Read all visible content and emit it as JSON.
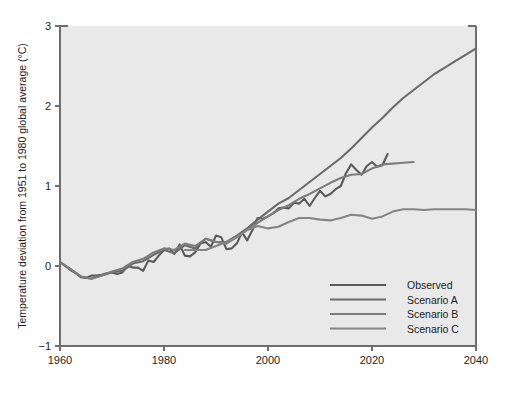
{
  "chart_data": {
    "type": "line",
    "title": "",
    "xlabel": "",
    "ylabel": "Temperature deviation from 1951 to 1980 global average (°C)",
    "xlim": [
      1960,
      2040
    ],
    "ylim": [
      -1,
      3
    ],
    "xticks": [
      1960,
      1980,
      2000,
      2020,
      2040
    ],
    "yticks": [
      -1,
      0,
      1,
      2,
      3
    ],
    "xtick_labels": [
      "1960",
      "1980",
      "2000",
      "2020",
      "2040"
    ],
    "ytick_labels": [
      "−1",
      "0",
      "1",
      "2",
      "3"
    ],
    "grid": false,
    "legend_position": "lower-right",
    "plot_background": "#e9e9e9",
    "series": [
      {
        "name": "Observed",
        "color": "#5a5a5a",
        "x": [
          1960,
          1961,
          1962,
          1963,
          1964,
          1965,
          1966,
          1967,
          1968,
          1969,
          1970,
          1971,
          1972,
          1973,
          1974,
          1975,
          1976,
          1977,
          1978,
          1979,
          1980,
          1981,
          1982,
          1983,
          1984,
          1985,
          1986,
          1987,
          1988,
          1989,
          1990,
          1991,
          1992,
          1993,
          1994,
          1995,
          1996,
          1997,
          1998,
          1999,
          2000,
          2001,
          2002,
          2003,
          2004,
          2005,
          2006,
          2007,
          2008,
          2009,
          2010,
          2011,
          2012,
          2013,
          2014,
          2015,
          2016,
          2017,
          2018,
          2019,
          2020,
          2021,
          2022,
          2023
        ],
        "y": [
          0.05,
          0.0,
          -0.05,
          -0.09,
          -0.14,
          -0.15,
          -0.12,
          -0.12,
          -0.11,
          -0.09,
          -0.08,
          -0.1,
          -0.08,
          0.0,
          -0.02,
          -0.02,
          -0.06,
          0.07,
          0.05,
          0.13,
          0.2,
          0.22,
          0.15,
          0.27,
          0.13,
          0.12,
          0.17,
          0.28,
          0.3,
          0.24,
          0.38,
          0.36,
          0.21,
          0.22,
          0.28,
          0.42,
          0.32,
          0.45,
          0.6,
          0.59,
          0.62,
          0.66,
          0.72,
          0.73,
          0.72,
          0.79,
          0.78,
          0.84,
          0.75,
          0.85,
          0.94,
          0.87,
          0.9,
          0.96,
          1.0,
          1.16,
          1.27,
          1.2,
          1.14,
          1.25,
          1.3,
          1.24,
          1.26,
          1.4
        ],
        "end_value": 1.4,
        "end_year": 2023
      },
      {
        "name": "Scenario A",
        "color": "#6b6b6b",
        "x": [
          1960,
          1962,
          1964,
          1966,
          1968,
          1970,
          1972,
          1974,
          1976,
          1978,
          1980,
          1982,
          1984,
          1986,
          1988,
          1990,
          1992,
          1994,
          1996,
          1998,
          2000,
          2002,
          2004,
          2006,
          2008,
          2010,
          2012,
          2014,
          2016,
          2018,
          2020,
          2022,
          2024,
          2026,
          2028,
          2030,
          2032,
          2034,
          2036,
          2038,
          2040
        ],
        "y": [
          0.05,
          -0.04,
          -0.13,
          -0.16,
          -0.12,
          -0.08,
          -0.06,
          0.03,
          0.06,
          0.14,
          0.2,
          0.16,
          0.26,
          0.22,
          0.34,
          0.3,
          0.3,
          0.38,
          0.47,
          0.58,
          0.68,
          0.78,
          0.85,
          0.95,
          1.05,
          1.15,
          1.25,
          1.35,
          1.47,
          1.6,
          1.73,
          1.85,
          1.98,
          2.1,
          2.2,
          2.3,
          2.4,
          2.48,
          2.56,
          2.64,
          2.72
        ],
        "end_value": 2.72,
        "end_year": 2040
      },
      {
        "name": "Scenario B",
        "color": "#7d7d7d",
        "x": [
          1960,
          1962,
          1964,
          1966,
          1968,
          1970,
          1972,
          1974,
          1976,
          1978,
          1980,
          1982,
          1984,
          1986,
          1988,
          1990,
          1992,
          1994,
          1996,
          1998,
          2000,
          2002,
          2004,
          2006,
          2008,
          2010,
          2012,
          2014,
          2016,
          2018,
          2020,
          2022,
          2024,
          2026,
          2028
        ],
        "y": [
          0.05,
          -0.04,
          -0.13,
          -0.16,
          -0.12,
          -0.07,
          -0.03,
          0.05,
          0.09,
          0.17,
          0.22,
          0.2,
          0.28,
          0.25,
          0.34,
          0.3,
          0.28,
          0.36,
          0.45,
          0.54,
          0.62,
          0.7,
          0.76,
          0.84,
          0.9,
          0.97,
          1.04,
          1.1,
          1.14,
          1.15,
          1.22,
          1.27,
          1.28,
          1.29,
          1.3
        ],
        "end_value": 1.3,
        "end_year": 2028
      },
      {
        "name": "Scenario C",
        "color": "#858585",
        "x": [
          1984,
          1986,
          1988,
          1990,
          1992,
          1994,
          1996,
          1998,
          2000,
          2002,
          2004,
          2006,
          2008,
          2010,
          2012,
          2014,
          2016,
          2018,
          2020,
          2022,
          2024,
          2026,
          2028,
          2030,
          2032,
          2034,
          2036,
          2038,
          2040
        ],
        "y": [
          0.2,
          0.2,
          0.2,
          0.25,
          0.3,
          0.36,
          0.45,
          0.5,
          0.47,
          0.49,
          0.55,
          0.6,
          0.6,
          0.58,
          0.57,
          0.6,
          0.64,
          0.63,
          0.59,
          0.62,
          0.68,
          0.71,
          0.71,
          0.7,
          0.71,
          0.71,
          0.71,
          0.71,
          0.7
        ],
        "end_value": 0.7,
        "end_year": 2040
      }
    ]
  },
  "legend": {
    "entries": [
      {
        "label": "Observed",
        "color": "#5a5a5a"
      },
      {
        "label": "Scenario A",
        "color": "#6b6b6b"
      },
      {
        "label": "Scenario B",
        "color": "#7d7d7d"
      },
      {
        "label": "Scenario C",
        "color": "#858585"
      }
    ]
  },
  "axes": {
    "y_title": "Temperature deviation from 1951 to 1980 global average (°C)"
  }
}
